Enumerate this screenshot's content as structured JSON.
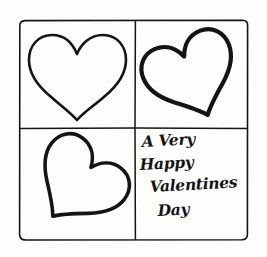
{
  "artwork": {
    "title": "A Very Happy Valentines Day",
    "medium": "hand-drawn ink sketch",
    "background_color": "#fdfdfc",
    "ink_color": "#141414"
  },
  "frame": {
    "name": "outer-frame",
    "x": 19,
    "y": 20,
    "width": 229,
    "height": 220,
    "corner_radius": 6,
    "stroke_width": 1.6
  },
  "dividers": {
    "vertical_x": 135,
    "horizontal_y": 128
  },
  "quadrants": [
    {
      "id": "top-left",
      "label": "heart upright",
      "content_type": "heart",
      "rotation_deg": 0,
      "stroke_width": 2.6,
      "center_x": 77,
      "center_y": 74,
      "scale": 1.0
    },
    {
      "id": "top-right",
      "label": "heart tilted left",
      "content_type": "heart",
      "rotation_deg": -22,
      "stroke_width": 4.2,
      "center_x": 192,
      "center_y": 76,
      "scale": 0.96
    },
    {
      "id": "bottom-left",
      "label": "heart tilted right",
      "content_type": "heart",
      "rotation_deg": 38,
      "stroke_width": 3.6,
      "center_x": 78,
      "center_y": 184,
      "scale": 0.94
    },
    {
      "id": "bottom-right",
      "label": "handwritten greeting",
      "content_type": "text"
    }
  ],
  "greeting": {
    "full_text": "A Very Happy Valentines Day",
    "lines": [
      {
        "text": "A Very",
        "x": 142,
        "y": 147,
        "font_size": 15.5
      },
      {
        "text": "Happy",
        "x": 140,
        "y": 170,
        "font_size": 15.5
      },
      {
        "text": "Valentines",
        "x": 150,
        "y": 192,
        "font_size": 15.5
      },
      {
        "text": "Day",
        "x": 158,
        "y": 216,
        "font_size": 16.5
      }
    ]
  }
}
